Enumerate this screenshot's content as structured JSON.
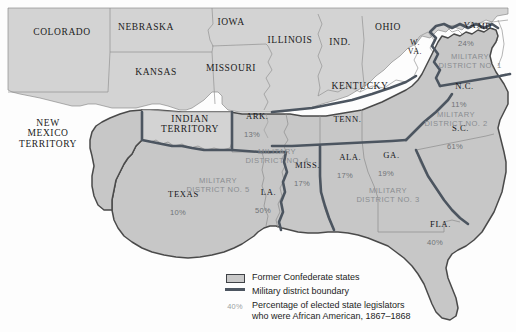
{
  "map": {
    "colors": {
      "confederate_fill": "#c8c8c8",
      "union_fill": "#d2d2d2",
      "ocean": "#fdfdfd",
      "state_border": "#8d8d8d",
      "district_boundary": "#4c5560",
      "confederate_outline": "#4a4a4a",
      "label_text": "#1b1b1b",
      "percent_text": "#6f7276"
    },
    "outside_states": [
      {
        "name": "COLORADO",
        "x": 62,
        "y": 32
      },
      {
        "name": "NEBRASKA",
        "x": 146,
        "y": 27
      },
      {
        "name": "IOWA",
        "x": 231,
        "y": 22
      },
      {
        "name": "KANSAS",
        "x": 156,
        "y": 72
      },
      {
        "name": "MISSOURI",
        "x": 231,
        "y": 68
      },
      {
        "name": "ILLINOIS",
        "x": 290,
        "y": 40
      },
      {
        "name": "IND.",
        "x": 340,
        "y": 42
      },
      {
        "name": "OHIO",
        "x": 388,
        "y": 27
      },
      {
        "name": "KENTUCKY",
        "x": 360,
        "y": 86
      },
      {
        "name": "NEW\nMEXICO\nTERRITORY",
        "x": 48,
        "y": 133
      },
      {
        "name": "INDIAN\nTERRITORY",
        "x": 190,
        "y": 124
      },
      {
        "name": "W.\nVA.",
        "x": 415,
        "y": 48
      },
      {
        "name": "MD.",
        "x": 486,
        "y": 27
      }
    ],
    "confederate_states": [
      {
        "name": "VA.",
        "pct": "24%",
        "x": 466,
        "y": 40
      },
      {
        "name": "N.C.",
        "pct": "11%",
        "x": 459,
        "y": 101
      },
      {
        "name": "S.C.",
        "pct": "61%",
        "x": 455,
        "y": 143
      },
      {
        "name": "TENN.",
        "pct": "",
        "x": 342,
        "y": 120
      },
      {
        "name": "ARK.",
        "pct": "13%",
        "x": 252,
        "y": 131
      },
      {
        "name": "MISS.",
        "pct": "17%",
        "x": 302,
        "y": 180
      },
      {
        "name": "ALA.",
        "pct": "17%",
        "x": 345,
        "y": 172
      },
      {
        "name": "GA.",
        "pct": "19%",
        "x": 386,
        "y": 170
      },
      {
        "name": "LA.",
        "pct": "50%",
        "x": 263,
        "y": 207
      },
      {
        "name": "TEXAS",
        "pct": "10%",
        "x": 178,
        "y": 209
      },
      {
        "name": "FLA.",
        "pct": "40%",
        "x": 435,
        "y": 239
      }
    ],
    "districts": [
      {
        "name": "MILITARY\nDISTRICT NO. 1",
        "x": 470,
        "y": 62
      },
      {
        "name": "MILITARY\nDISTRICT NO. 2",
        "x": 456,
        "y": 120
      },
      {
        "name": "MILITARY\nDISTRICT NO. 3",
        "x": 388,
        "y": 196
      },
      {
        "name": "MILITARY\nDISTRICT NO. 4",
        "x": 277,
        "y": 157
      },
      {
        "name": "MILITARY\nDISTRICT NO. 5",
        "x": 218,
        "y": 186
      }
    ]
  },
  "legend": {
    "items": [
      {
        "key": "box",
        "label": "Former Confederate states"
      },
      {
        "key": "line",
        "label": "Military district boundary"
      },
      {
        "key": "pct",
        "key_text": "40%",
        "label": "Percentage of elected state legislators\nwho were African American, 1867–1868"
      }
    ]
  }
}
